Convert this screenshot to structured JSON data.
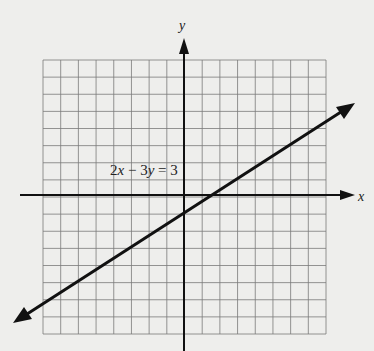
{
  "chart_data": {
    "type": "line",
    "title": "",
    "equation_label": "2x − 3y = 3",
    "xlabel": "x",
    "ylabel": "y",
    "xlim": [
      -8,
      8
    ],
    "ylim": [
      -8,
      8
    ],
    "grid": true,
    "grid_step": 1,
    "series": [
      {
        "name": "2x − 3y = 3",
        "slope": 0.6667,
        "intercept": -1,
        "x": [
          -9.5,
          -3,
          0,
          1.5,
          3,
          9.5
        ],
        "y": [
          -7.33,
          -3,
          -1,
          0,
          1,
          5.33
        ]
      }
    ],
    "annotations": [
      {
        "text": "2x − 3y = 3",
        "x": -4,
        "y": 1.5
      }
    ]
  },
  "labels": {
    "x_axis": "x",
    "y_axis": "y",
    "equation_parts": {
      "a": "2",
      "x": "x",
      "op": " − 3",
      "y": "y",
      "rhs": " = 3"
    }
  },
  "colors": {
    "background": "#eeeeec",
    "grid": "#7a7a7a",
    "axis": "#111111",
    "line": "#111111"
  }
}
